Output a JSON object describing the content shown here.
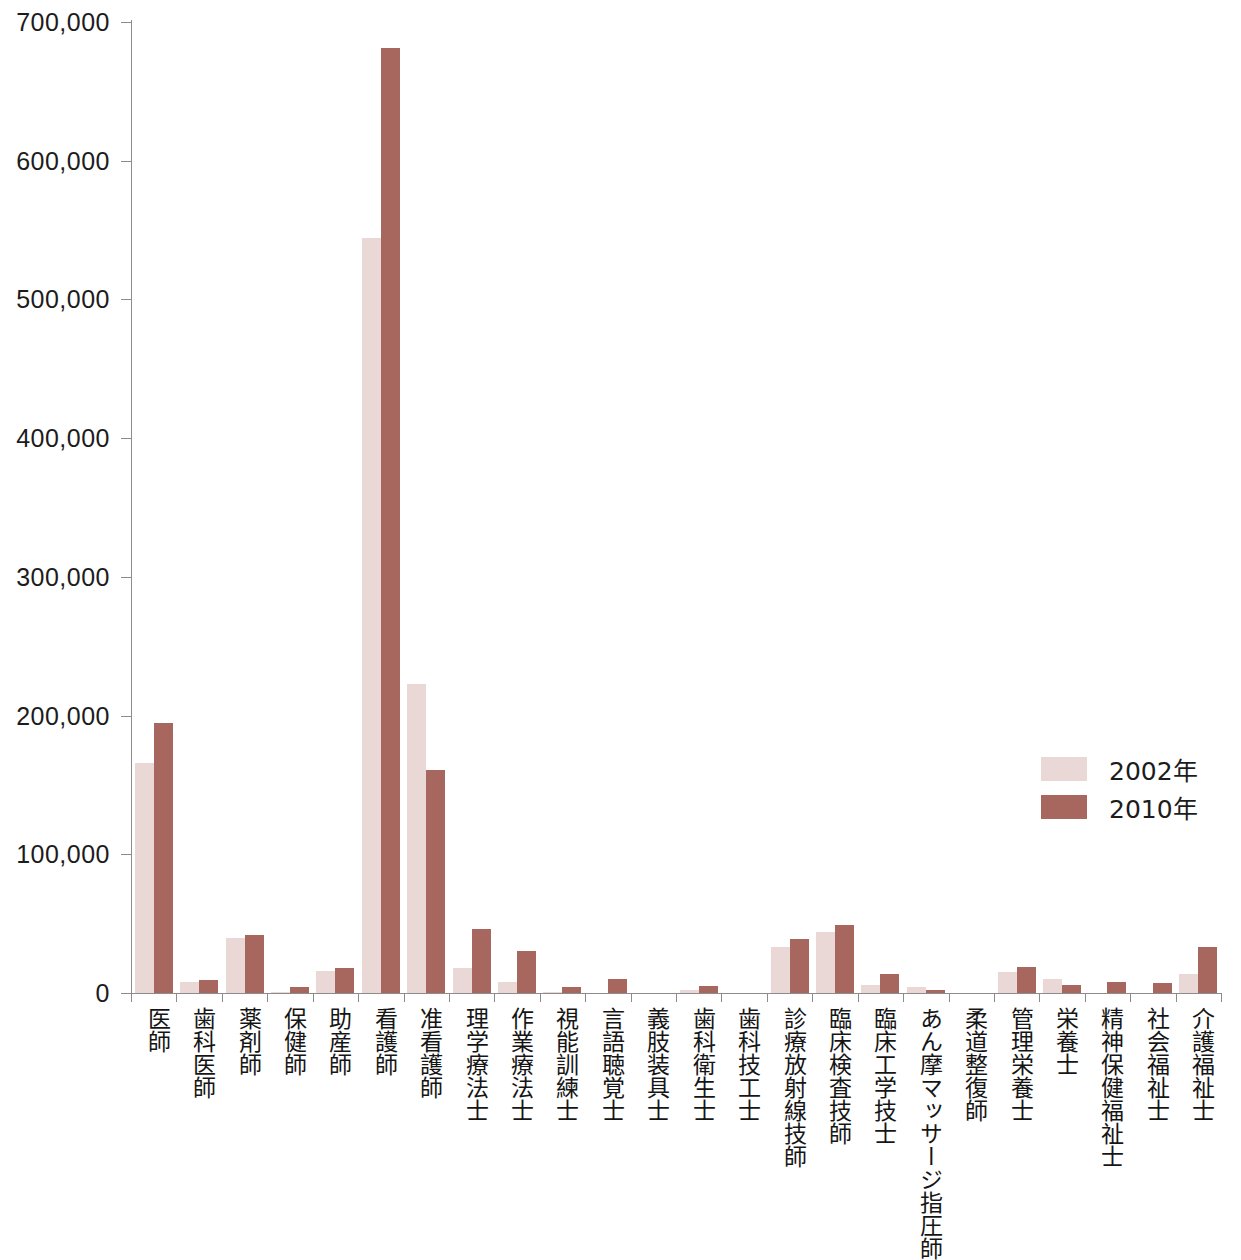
{
  "chart_data": {
    "type": "bar",
    "title": "",
    "subtitle": "",
    "xlabel": "",
    "ylabel": "",
    "ylim": [
      0,
      700000
    ],
    "ytick_labels": [
      "0",
      "100,000",
      "200,000",
      "300,000",
      "400,000",
      "500,000",
      "600,000",
      "700,000"
    ],
    "ytick_values": [
      0,
      100000,
      200000,
      300000,
      400000,
      500000,
      600000,
      700000
    ],
    "grid": false,
    "legend_position": "right-middle",
    "colors": {
      "series_2002": "#e9d8d5",
      "series_2010": "#a8675e",
      "axis": "#8c8c8c",
      "text": "#1c1c1c",
      "background": "#ffffff"
    },
    "categories": [
      "医師",
      "歯科医師",
      "薬剤師",
      "保健師",
      "助産師",
      "看護師",
      "准看護師",
      "理学療法士",
      "作業療法士",
      "視能訓練士",
      "言語聴覚士",
      "義肢装具士",
      "歯科衛生士",
      "歯科技工士",
      "診療放射線技師",
      "臨床検査技師",
      "臨床工学技士",
      "あん摩マッサージ指圧師",
      "柔道整復師",
      "管理栄養士",
      "栄養士",
      "精神保健福祉士",
      "社会福祉士",
      "介護福祉士"
    ],
    "series": [
      {
        "name": "2002年",
        "color": "#e9d8d5",
        "values": [
          166000,
          8000,
          40000,
          1000,
          16000,
          544000,
          223000,
          18000,
          8000,
          1000,
          0,
          0,
          2000,
          0,
          33000,
          44000,
          6000,
          4500,
          0,
          15000,
          10000,
          0,
          0,
          14000
        ]
      },
      {
        "name": "2010年",
        "color": "#a8675e",
        "values": [
          195000,
          9500,
          42000,
          4000,
          18000,
          681000,
          161000,
          46000,
          30000,
          4000,
          10000,
          0,
          5000,
          0,
          39000,
          49000,
          14000,
          2500,
          0,
          19000,
          6000,
          8000,
          7000,
          33000
        ]
      }
    ]
  },
  "legend": {
    "items": [
      {
        "label": "2002年",
        "color": "#e9d8d5"
      },
      {
        "label": "2010年",
        "color": "#a8675e"
      }
    ]
  }
}
